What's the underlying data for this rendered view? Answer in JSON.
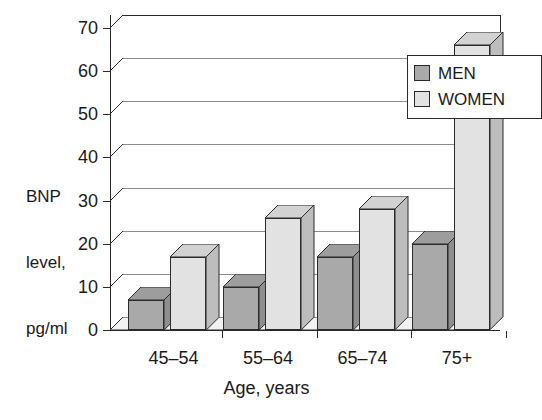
{
  "chart_data": {
    "type": "bar",
    "title": "",
    "subtitle": "",
    "xlabel": "Age, years",
    "ylabel": "BNP level,\npg/ml",
    "ylabel_lines": [
      "BNP",
      "level,",
      "pg/ml"
    ],
    "categories": [
      "45–54",
      "55–64",
      "65–74",
      "75+"
    ],
    "series": [
      {
        "name": "MEN",
        "values": [
          7,
          10,
          17,
          20
        ],
        "color": "#a9a9a9"
      },
      {
        "name": "WOMEN",
        "values": [
          17,
          26,
          28,
          66
        ],
        "color": "#e2e2e2"
      }
    ],
    "ylim": [
      0,
      70
    ],
    "ytick_values": [
      0,
      10,
      20,
      30,
      40,
      50,
      60,
      70
    ],
    "ytick_labels": [
      "0",
      "10",
      "20",
      "30",
      "40",
      "50",
      "60",
      "70"
    ],
    "grid": true,
    "grid_axis": "y",
    "legend_position": "upper right",
    "style": "3d-grayscale"
  },
  "legend": {
    "items": [
      {
        "label": "MEN",
        "swatch": "men-swatch"
      },
      {
        "label": "WOMEN",
        "swatch": "women-swatch"
      }
    ]
  },
  "colors": {
    "men_face": "#a9a9a9",
    "women_face": "#e2e2e2",
    "axis": "#2b2b2b",
    "gridline": "#8c8c8c",
    "background": "#ffffff"
  }
}
